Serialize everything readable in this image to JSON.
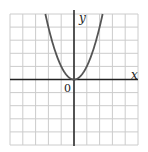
{
  "chart_data": {
    "type": "line",
    "title": "",
    "function": "y = x^2",
    "xlabel": "x",
    "ylabel": "y",
    "origin_label": "0",
    "xlim": [
      -5,
      5
    ],
    "ylim": [
      -5,
      5
    ],
    "grid": true,
    "grid_step": 1,
    "legend": null,
    "series": [
      {
        "name": "y = x^2",
        "x": [
          -2.236,
          -2,
          -1.5,
          -1,
          -0.5,
          0,
          0.5,
          1,
          1.5,
          2,
          2.236
        ],
        "y": [
          5,
          4,
          2.25,
          1,
          0.25,
          0,
          0.25,
          1,
          2.25,
          4,
          5
        ]
      }
    ],
    "colors": {
      "curve": "#555555",
      "axes": "#222222",
      "grid": "#cccccc",
      "background": "#ffffff"
    }
  },
  "labels": {
    "x_axis": "x",
    "y_axis": "y",
    "origin": "0"
  }
}
